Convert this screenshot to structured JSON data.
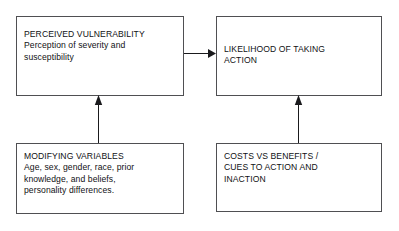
{
  "diagram": {
    "background_color": "#ffffff",
    "border_color": "#4f4f52",
    "text_color": "#111114",
    "nodes": [
      {
        "id": "perceived-vulnerability",
        "heading": "PERCEIVED VULNERABILITY",
        "body": "Perception of severity and susceptibility",
        "text": "PERCEIVED VULNERABILITY\nPerception of severity and\nsusceptibility"
      },
      {
        "id": "likelihood-action",
        "heading": "LIKELIHOOD OF TAKING ACTION",
        "body": "",
        "text": "LIKELIHOOD OF TAKING\nACTION"
      },
      {
        "id": "modifying-variables",
        "heading": "MODIFYING VARIABLES",
        "body": "Age, sex, gender, race, prior knowledge, and beliefs, personality differences.",
        "text": "MODIFYING VARIABLES\nAge, sex, gender, race, prior\nknowledge, and beliefs,\npersonality differences."
      },
      {
        "id": "costs-benefits",
        "heading": "COSTS VS BENEFITS / CUES TO ACTION AND INACTION",
        "body": "",
        "text": "COSTS VS BENEFITS /\nCUES TO ACTION AND\nINACTION"
      }
    ],
    "arrows": [
      {
        "id": "perceived-vulnerability-to-likelihood",
        "from": "perceived-vulnerability",
        "to": "likelihood-action",
        "direction": "right"
      },
      {
        "id": "modifying-variables-to-perceived-vulnerability",
        "from": "modifying-variables",
        "to": "perceived-vulnerability",
        "direction": "up"
      },
      {
        "id": "costs-benefits-to-likelihood",
        "from": "costs-benefits",
        "to": "likelihood-action",
        "direction": "up"
      }
    ]
  }
}
